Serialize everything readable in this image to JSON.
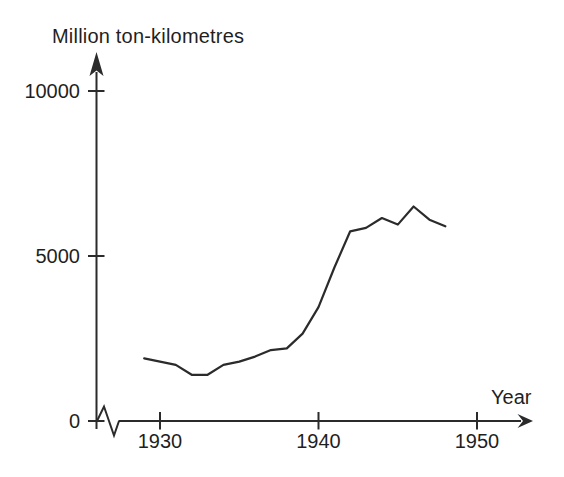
{
  "figure": {
    "background_color": "#ffffff",
    "ink_color": "#2b2b2b",
    "text_color": "#1f1f1f"
  },
  "chart_data": {
    "type": "line",
    "ylabel": "Million ton-kilometres",
    "xlabel": "Year",
    "x": [
      1929,
      1930,
      1931,
      1932,
      1933,
      1934,
      1935,
      1936,
      1937,
      1938,
      1939,
      1940,
      1941,
      1942,
      1943,
      1944,
      1945,
      1946,
      1947,
      1948
    ],
    "values": [
      1900,
      1800,
      1700,
      1400,
      1400,
      1700,
      1800,
      1950,
      2150,
      2200,
      2650,
      3450,
      4650,
      5750,
      5850,
      6150,
      5950,
      6500,
      6100,
      5900
    ],
    "x_ticks": [
      {
        "value": 1930,
        "label": "1930"
      },
      {
        "value": 1940,
        "label": "1940"
      },
      {
        "value": 1950,
        "label": "1950"
      }
    ],
    "y_ticks": [
      {
        "value": 0,
        "label": "0"
      },
      {
        "value": 5000,
        "label": "5000"
      },
      {
        "value": 10000,
        "label": "10000"
      }
    ],
    "xlim": [
      1927,
      1953.5
    ],
    "ylim": [
      0,
      11200
    ],
    "grid": false,
    "legend_position": "none",
    "x_axis_break_near_origin": true,
    "line_color": "#2b2b2b"
  }
}
